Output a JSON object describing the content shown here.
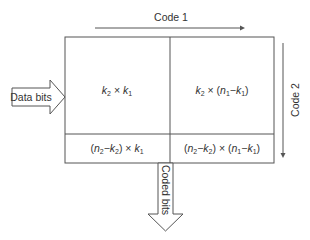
{
  "diagram": {
    "code1_label": "Code 1",
    "code2_label": "Code 2",
    "input_label": "Data bits",
    "output_label": "Coded bits",
    "cells": {
      "top_left": "k2 × k1",
      "top_right": "k2 × (n1−k1)",
      "bottom_left": "(n2−k2) × k1",
      "bottom_right": "(n2−k2) × (n1−k1)"
    },
    "colors": {
      "line": "#555555",
      "text": "#333333",
      "background": "#ffffff"
    }
  }
}
